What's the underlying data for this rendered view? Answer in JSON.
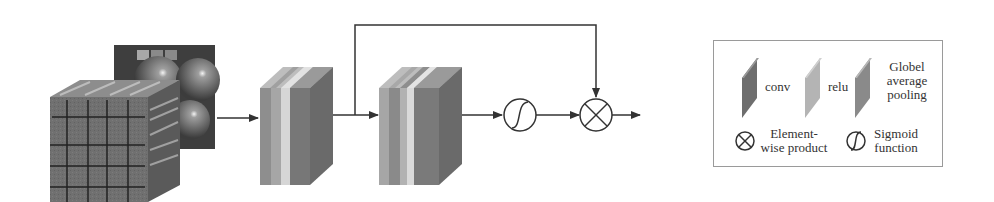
{
  "diagram": {
    "input": {
      "label": "input-image-stack"
    },
    "blocks": [
      {
        "name": "block-1",
        "layers": [
          "conv",
          "relu",
          "conv"
        ]
      },
      {
        "name": "block-2",
        "layers": [
          "conv",
          "relu",
          "conv",
          "Globel average pooling"
        ]
      }
    ],
    "operators": [
      {
        "name": "sigmoid",
        "symbol": "∫"
      },
      {
        "name": "element-wise-product",
        "symbol": "⊗"
      }
    ],
    "colors": {
      "conv": "#6e6e6e",
      "relu": "#a8a8a8",
      "relu_light": "#d2d2d2",
      "gap": "#8a8a8a",
      "line": "#333333"
    }
  },
  "legend": {
    "conv": "conv",
    "relu": "relu",
    "gap_line1": "Globel",
    "gap_line2": "average",
    "gap_line3": "pooling",
    "product_line1": "Element-",
    "product_line2": "wise product",
    "sigmoid_line1": "Sigmoid",
    "sigmoid_line2": "function"
  }
}
